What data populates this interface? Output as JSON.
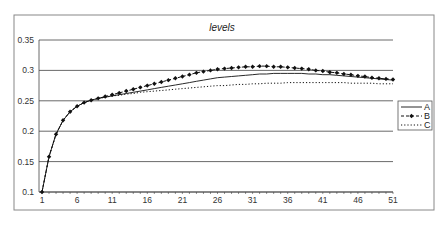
{
  "chart_data": {
    "type": "line",
    "title": "levels",
    "xlabel": "",
    "ylabel": "",
    "ylim": [
      0.1,
      0.35
    ],
    "xlim": [
      1,
      51
    ],
    "yticks": [
      0.1,
      0.15,
      0.2,
      0.25,
      0.3,
      0.35
    ],
    "ytick_labels": [
      "0.1",
      "0.15",
      "0.2",
      "0.25",
      "0.3",
      "0.35"
    ],
    "xtick_labels": [
      "1",
      "6",
      "11",
      "16",
      "21",
      "26",
      "31",
      "36",
      "41",
      "46",
      "51"
    ],
    "grid": "horizontal",
    "legend_position": "right",
    "x": [
      1,
      2,
      3,
      4,
      5,
      6,
      7,
      8,
      9,
      10,
      11,
      12,
      13,
      14,
      15,
      16,
      17,
      18,
      19,
      20,
      21,
      22,
      23,
      24,
      25,
      26,
      27,
      28,
      29,
      30,
      31,
      32,
      33,
      34,
      35,
      36,
      37,
      38,
      39,
      40,
      41,
      42,
      43,
      44,
      45,
      46,
      47,
      48,
      49,
      50,
      51
    ],
    "series": [
      {
        "name": "A",
        "style": "solid",
        "values": [
          0.1,
          0.158,
          0.195,
          0.218,
          0.232,
          0.241,
          0.247,
          0.251,
          0.254,
          0.256,
          0.258,
          0.26,
          0.262,
          0.264,
          0.266,
          0.268,
          0.27,
          0.272,
          0.274,
          0.276,
          0.278,
          0.28,
          0.282,
          0.284,
          0.286,
          0.288,
          0.289,
          0.29,
          0.291,
          0.292,
          0.293,
          0.294,
          0.294,
          0.295,
          0.295,
          0.295,
          0.295,
          0.295,
          0.294,
          0.294,
          0.293,
          0.293,
          0.292,
          0.291,
          0.29,
          0.289,
          0.288,
          0.287,
          0.286,
          0.285,
          0.284
        ]
      },
      {
        "name": "B",
        "style": "dashed-diamond",
        "values": [
          0.1,
          0.158,
          0.195,
          0.218,
          0.232,
          0.241,
          0.247,
          0.251,
          0.254,
          0.257,
          0.26,
          0.263,
          0.266,
          0.269,
          0.272,
          0.275,
          0.278,
          0.281,
          0.284,
          0.287,
          0.29,
          0.293,
          0.296,
          0.298,
          0.3,
          0.302,
          0.303,
          0.304,
          0.305,
          0.306,
          0.306,
          0.307,
          0.307,
          0.306,
          0.306,
          0.305,
          0.304,
          0.303,
          0.302,
          0.3,
          0.299,
          0.297,
          0.296,
          0.294,
          0.293,
          0.291,
          0.29,
          0.288,
          0.287,
          0.286,
          0.285
        ]
      },
      {
        "name": "C",
        "style": "dotted",
        "values": [
          0.1,
          0.158,
          0.195,
          0.218,
          0.232,
          0.241,
          0.247,
          0.251,
          0.254,
          0.256,
          0.258,
          0.259,
          0.261,
          0.262,
          0.264,
          0.265,
          0.266,
          0.267,
          0.268,
          0.269,
          0.27,
          0.271,
          0.272,
          0.273,
          0.274,
          0.275,
          0.275,
          0.276,
          0.277,
          0.277,
          0.278,
          0.278,
          0.279,
          0.279,
          0.279,
          0.28,
          0.28,
          0.28,
          0.28,
          0.28,
          0.28,
          0.28,
          0.28,
          0.28,
          0.279,
          0.279,
          0.279,
          0.279,
          0.278,
          0.278,
          0.278
        ]
      }
    ]
  },
  "colors": {
    "line": "#111111",
    "grid": "#444444",
    "frame": "#888888"
  }
}
